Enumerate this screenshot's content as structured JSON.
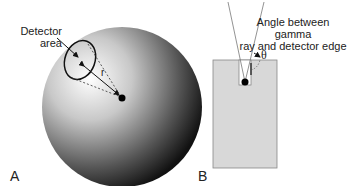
{
  "panel_a": {
    "label": "A",
    "detector_label_line1": "Detector",
    "detector_label_line2": "area",
    "radius_label": "r"
  },
  "panel_b": {
    "label": "B",
    "angle_label_line1": "Angle between gamma",
    "angle_label_line2": "ray and detector edge",
    "theta_label": "θ"
  }
}
